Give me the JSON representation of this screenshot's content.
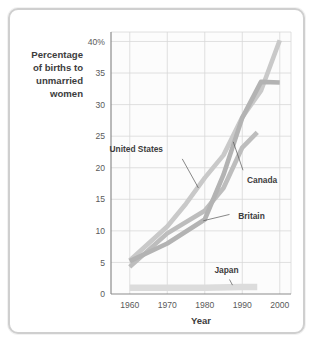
{
  "figure": {
    "frame_border_color": "#cfcfcf",
    "background_color": "#ffffff"
  },
  "chart_data": {
    "type": "line",
    "title": "",
    "subtitle": "",
    "xlabel": "Year",
    "ylabel": "Percentage of births to unmarried women",
    "ylabel_lines": [
      "Percentage",
      "of births to",
      "unmarried",
      "women"
    ],
    "xlim": [
      1955,
      2003
    ],
    "ylim": [
      0,
      41.5
    ],
    "xticks": [
      1960,
      1970,
      1980,
      1990,
      2000
    ],
    "xtick_labels": [
      "1960",
      "1970",
      "1980",
      "1990",
      "2000"
    ],
    "yticks": [
      0,
      5,
      10,
      15,
      20,
      25,
      30,
      35,
      40
    ],
    "ytick_labels": [
      "0",
      "5",
      "10",
      "15",
      "20",
      "25",
      "30",
      "35",
      "40%"
    ],
    "grid": true,
    "grid_color": "#d8d8d8",
    "legend": "none",
    "series": [
      {
        "name": "United States",
        "color": "#c9c9c9",
        "x": [
          1960,
          1970,
          1975,
          1980,
          1985,
          1990,
          1995,
          2000
        ],
        "values": [
          5.3,
          10.7,
          14.3,
          18.4,
          22.0,
          28.0,
          32.2,
          40.2
        ]
      },
      {
        "name": "Canada",
        "color": "#bdbdbd",
        "x": [
          1960,
          1970,
          1980,
          1985,
          1990,
          1994
        ],
        "values": [
          4.3,
          9.6,
          13.2,
          16.8,
          23.2,
          25.6
        ]
      },
      {
        "name": "Britain",
        "color": "#b3b3b3",
        "x": [
          1960,
          1970,
          1980,
          1985,
          1990,
          1995,
          2000
        ],
        "values": [
          5.2,
          8.0,
          11.8,
          18.9,
          27.9,
          33.6,
          33.5
        ]
      },
      {
        "name": "Japan",
        "color": "#dcdcdc",
        "x": [
          1960,
          1970,
          1980,
          1990,
          1994
        ],
        "values": [
          1.0,
          1.0,
          1.0,
          1.1,
          1.1
        ]
      }
    ],
    "annotations": [
      {
        "label": "United States",
        "x": 1969.4,
        "y": 23.0
      },
      {
        "label": "Canada",
        "x": 1991.0,
        "y": 18.0
      },
      {
        "label": "Britain",
        "x": 1988.4,
        "y": 12.4
      },
      {
        "label": "Japan",
        "x": 1985.8,
        "y": 3.3
      }
    ]
  }
}
